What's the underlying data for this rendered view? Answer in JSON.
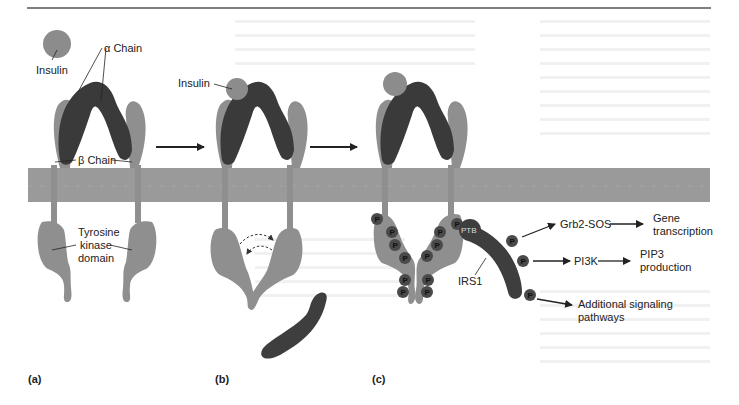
{
  "figure": {
    "colors": {
      "membrane": "#9a9a9a",
      "alpha_chain": "#3a3a3a",
      "beta_chain": "#8f8f8f",
      "insulin": "#8c8c8c",
      "phosphate": "#4a4a4a",
      "irs1": "#3e3e3e",
      "text": "#222222",
      "top_rule": "#555555"
    },
    "panels": [
      {
        "id": "a",
        "label": "(a)"
      },
      {
        "id": "b",
        "label": "(b)"
      },
      {
        "id": "c",
        "label": "(c)"
      }
    ],
    "labels": {
      "insulin_a": "Insulin",
      "alpha_chain": "α Chain",
      "beta_chain": "β Chain",
      "tyrosine_kinase_line1": "Tyrosine",
      "tyrosine_kinase_line2": "kinase",
      "tyrosine_kinase_line3": "domain",
      "insulin_b": "Insulin",
      "ptb": "PTB",
      "irs1": "IRS1",
      "phosphate": "P"
    },
    "pathways": [
      {
        "source": "Grb2-SOS",
        "target_line1": "Gene",
        "target_line2": "transcription"
      },
      {
        "source": "PI3K",
        "target_line1": "PIP3",
        "target_line2": "production"
      },
      {
        "source": "",
        "target_line1": "Additional signaling",
        "target_line2": "pathways"
      }
    ]
  }
}
